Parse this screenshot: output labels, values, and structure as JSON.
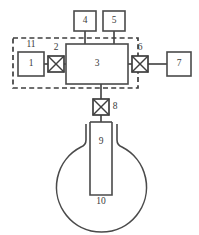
{
  "diagram": {
    "type": "schematic",
    "background_color": "#ffffff",
    "line_color": "#4a4a4a",
    "enclosure": {
      "name": "dashed-enclosure",
      "style": "dashed-rectangle",
      "x": 13,
      "y": 38,
      "width": 125,
      "height": 50
    },
    "components": [
      {
        "id": "1",
        "label": "1",
        "shape": "rectangle",
        "x": 18,
        "y": 52,
        "width": 26,
        "height": 24
      },
      {
        "id": "11",
        "label": "11",
        "shape": "annotation",
        "x": 31,
        "y": 46
      },
      {
        "id": "2",
        "label": "2",
        "shape": "valve",
        "x": 48,
        "y": 56,
        "width": 16,
        "height": 16
      },
      {
        "id": "3",
        "label": "3",
        "shape": "rectangle",
        "x": 66,
        "y": 44,
        "width": 62,
        "height": 40
      },
      {
        "id": "4",
        "label": "4",
        "shape": "rectangle",
        "x": 74,
        "y": 11,
        "width": 22,
        "height": 20
      },
      {
        "id": "5",
        "label": "5",
        "shape": "rectangle",
        "x": 103,
        "y": 11,
        "width": 22,
        "height": 20
      },
      {
        "id": "6",
        "label": "6",
        "shape": "valve",
        "x": 132,
        "y": 56,
        "width": 16,
        "height": 16
      },
      {
        "id": "7",
        "label": "7",
        "shape": "rectangle",
        "x": 167,
        "y": 52,
        "width": 24,
        "height": 24
      },
      {
        "id": "8",
        "label": "8",
        "shape": "valve",
        "x": 93,
        "y": 99,
        "width": 16,
        "height": 16
      },
      {
        "id": "9",
        "label": "9",
        "shape": "inner-tube",
        "x": 90,
        "y": 122,
        "width": 22,
        "height": 73
      },
      {
        "id": "10",
        "label": "10",
        "shape": "round-flask",
        "cx": 102,
        "cy": 183,
        "r": 45
      }
    ],
    "labels": [
      {
        "name": "label-1",
        "text": "1",
        "x": 31,
        "y": 64
      },
      {
        "name": "label-11",
        "text": "11",
        "x": 31,
        "y": 45
      },
      {
        "name": "label-2",
        "text": "2",
        "x": 56,
        "y": 48
      },
      {
        "name": "label-3",
        "text": "3",
        "x": 97,
        "y": 64
      },
      {
        "name": "label-4",
        "text": "4",
        "x": 85,
        "y": 21
      },
      {
        "name": "label-5",
        "text": "5",
        "x": 114,
        "y": 21
      },
      {
        "name": "label-6",
        "text": "6",
        "x": 140,
        "y": 48
      },
      {
        "name": "label-7",
        "text": "7",
        "x": 179,
        "y": 64
      },
      {
        "name": "label-8",
        "text": "8",
        "x": 115,
        "y": 107
      },
      {
        "name": "label-9",
        "text": "9",
        "x": 101,
        "y": 142
      },
      {
        "name": "label-10",
        "text": "10",
        "x": 101,
        "y": 202
      }
    ],
    "connections": [
      {
        "name": "conn-1-to-2",
        "from": "1",
        "to": "2"
      },
      {
        "name": "conn-2-to-3",
        "from": "2",
        "to": "3"
      },
      {
        "name": "conn-4-to-3",
        "from": "4",
        "to": "3"
      },
      {
        "name": "conn-5-to-3",
        "from": "5",
        "to": "3"
      },
      {
        "name": "conn-3-to-6",
        "from": "3",
        "to": "6"
      },
      {
        "name": "conn-6-to-7",
        "from": "6",
        "to": "7"
      },
      {
        "name": "conn-3-to-8",
        "from": "3",
        "to": "8"
      },
      {
        "name": "conn-8-to-9",
        "from": "8",
        "to": "9"
      }
    ]
  }
}
